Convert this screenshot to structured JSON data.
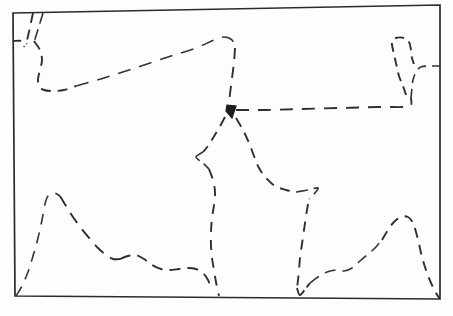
{
  "figure": {
    "kind": "hand-drawn-sketch-map",
    "title": "",
    "caption": "",
    "background_color": "#fdfdfc",
    "ink_color": "#2f2f33",
    "frame": {
      "name": "map-border",
      "style": "solid",
      "corners": [
        [
          13,
          13
        ],
        [
          440,
          5
        ],
        [
          440,
          299
        ],
        [
          15,
          296
        ]
      ]
    },
    "boundaries": [
      {
        "id": "northwest-inlet",
        "label": "",
        "style": "dashed",
        "dash_pattern": "10 7",
        "points": [
          [
            33,
            13
          ],
          [
            30,
            27
          ],
          [
            27,
            40
          ],
          [
            24,
            47
          ]
        ]
      },
      {
        "id": "northwest-inlet-second",
        "label": "",
        "style": "dashed",
        "dash_pattern": "11 6",
        "points": [
          [
            43,
            13
          ],
          [
            39,
            26
          ],
          [
            35,
            39
          ],
          [
            32,
            45
          ]
        ]
      },
      {
        "id": "west-edge-stub",
        "label": "",
        "style": "dashed",
        "dash_pattern": "8 6",
        "points": [
          [
            13,
            41
          ],
          [
            22,
            41
          ],
          [
            27,
            44
          ]
        ]
      },
      {
        "id": "northwest-lobe",
        "label": "",
        "style": "dashed",
        "dash_pattern": "10 7",
        "points": [
          [
            34,
            41
          ],
          [
            40,
            50
          ],
          [
            42,
            60
          ],
          [
            40,
            70
          ],
          [
            38,
            79
          ],
          [
            39,
            86
          ],
          [
            44,
            90
          ],
          [
            54,
            91
          ],
          [
            64,
            90
          ],
          [
            76,
            86
          ]
        ]
      },
      {
        "id": "north-long-ridge",
        "label": "",
        "style": "dashed",
        "dash_pattern": "13 9",
        "points": [
          [
            76,
            86
          ],
          [
            104,
            78
          ],
          [
            135,
            68
          ],
          [
            168,
            57
          ],
          [
            196,
            48
          ],
          [
            214,
            40
          ],
          [
            224,
            37
          ],
          [
            232,
            40
          ],
          [
            235,
            48
          ]
        ]
      },
      {
        "id": "central-descender",
        "label": "",
        "style": "dashed",
        "dash_pattern": "11 8",
        "points": [
          [
            235,
            48
          ],
          [
            234,
            62
          ],
          [
            232,
            78
          ],
          [
            230,
            94
          ],
          [
            229,
            104
          ]
        ]
      },
      {
        "id": "east-horizontal",
        "label": "",
        "style": "dashed",
        "dash_pattern": "13 9",
        "points": [
          [
            236,
            110
          ],
          [
            265,
            110
          ],
          [
            300,
            109
          ],
          [
            340,
            108
          ],
          [
            378,
            107
          ],
          [
            404,
            107
          ],
          [
            411,
            105
          ],
          [
            411,
            98
          ]
        ]
      },
      {
        "id": "northeast-peninsula-east-side",
        "label": "",
        "style": "dashed",
        "dash_pattern": "9 6",
        "points": [
          [
            411,
            98
          ],
          [
            412,
            88
          ],
          [
            413,
            80
          ],
          [
            416,
            72
          ],
          [
            421,
            67
          ],
          [
            430,
            66
          ],
          [
            440,
            66
          ]
        ]
      },
      {
        "id": "northeast-peninsula-west-side",
        "label": "",
        "style": "dashed",
        "dash_pattern": "9 6",
        "points": [
          [
            406,
            95
          ],
          [
            403,
            86
          ],
          [
            399,
            76
          ],
          [
            396,
            63
          ],
          [
            393,
            50
          ],
          [
            392,
            42
          ],
          [
            396,
            38
          ],
          [
            404,
            38
          ],
          [
            409,
            42
          ],
          [
            411,
            50
          ],
          [
            412,
            58
          ],
          [
            414,
            64
          ]
        ]
      },
      {
        "id": "central-peak-west-flank",
        "label": "",
        "style": "dashed",
        "dash_pattern": "10 7",
        "points": [
          [
            225,
            117
          ],
          [
            219,
            128
          ],
          [
            213,
            138
          ],
          [
            208,
            146
          ],
          [
            203,
            152
          ]
        ]
      },
      {
        "id": "central-notch",
        "label": "",
        "style": "dashed",
        "dash_pattern": "14 5",
        "points": [
          [
            203,
            152
          ],
          [
            196,
            157
          ],
          [
            203,
            163
          ],
          [
            209,
            169
          ]
        ]
      },
      {
        "id": "central-west-descender",
        "label": "",
        "style": "dashed",
        "dash_pattern": "10 8",
        "points": [
          [
            209,
            169
          ],
          [
            213,
            180
          ],
          [
            215,
            192
          ],
          [
            214,
            205
          ],
          [
            212,
            218
          ],
          [
            211,
            232
          ],
          [
            211,
            246
          ],
          [
            212,
            258
          ],
          [
            214,
            270
          ],
          [
            216,
            282
          ],
          [
            218,
            291
          ],
          [
            219,
            296
          ]
        ]
      },
      {
        "id": "central-peak-east-flank",
        "label": "",
        "style": "dashed",
        "dash_pattern": "10 7",
        "points": [
          [
            236,
            118
          ],
          [
            243,
            130
          ],
          [
            249,
            143
          ],
          [
            254,
            156
          ],
          [
            259,
            168
          ],
          [
            266,
            178
          ],
          [
            275,
            186
          ],
          [
            286,
            190
          ],
          [
            296,
            192
          ]
        ]
      },
      {
        "id": "central-east-hook",
        "label": "",
        "style": "dashed",
        "dash_pattern": "12 6",
        "points": [
          [
            296,
            192
          ],
          [
            308,
            190
          ],
          [
            318,
            188
          ],
          [
            314,
            194
          ],
          [
            309,
            199
          ]
        ]
      },
      {
        "id": "south-central-descender",
        "label": "",
        "style": "dashed",
        "dash_pattern": "10 8",
        "points": [
          [
            308,
            204
          ],
          [
            306,
            216
          ],
          [
            304,
            230
          ],
          [
            302,
            244
          ],
          [
            300,
            258
          ],
          [
            299,
            270
          ],
          [
            298,
            280
          ],
          [
            297,
            288
          ]
        ]
      },
      {
        "id": "south-central-vee",
        "label": "",
        "style": "dashed",
        "dash_pattern": "14 4",
        "points": [
          [
            297,
            288
          ],
          [
            300,
            295
          ],
          [
            306,
            288
          ],
          [
            310,
            283
          ]
        ]
      },
      {
        "id": "southwest-rise",
        "label": "",
        "style": "dashed",
        "dash_pattern": "11 8",
        "points": [
          [
            16,
            296
          ],
          [
            22,
            286
          ],
          [
            28,
            272
          ],
          [
            33,
            256
          ],
          [
            38,
            238
          ],
          [
            42,
            220
          ],
          [
            45,
            204
          ],
          [
            48,
            196
          ],
          [
            54,
            193
          ],
          [
            60,
            196
          ]
        ]
      },
      {
        "id": "southwest-descent",
        "label": "",
        "style": "dashed",
        "dash_pattern": "12 8",
        "points": [
          [
            60,
            196
          ],
          [
            66,
            206
          ],
          [
            73,
            217
          ],
          [
            81,
            228
          ],
          [
            90,
            239
          ],
          [
            98,
            248
          ],
          [
            106,
            255
          ],
          [
            113,
            259
          ],
          [
            120,
            259
          ]
        ]
      },
      {
        "id": "south-wavy-belt",
        "label": "",
        "style": "dashed",
        "dash_pattern": "11 7",
        "points": [
          [
            120,
            259
          ],
          [
            128,
            256
          ],
          [
            136,
            255
          ],
          [
            144,
            259
          ],
          [
            152,
            265
          ],
          [
            161,
            269
          ],
          [
            170,
            270
          ],
          [
            179,
            269
          ],
          [
            188,
            268
          ],
          [
            196,
            269
          ],
          [
            203,
            273
          ],
          [
            208,
            280
          ],
          [
            211,
            288
          ]
        ]
      },
      {
        "id": "southeast-wavy-belt",
        "label": "",
        "style": "dashed",
        "dash_pattern": "11 7",
        "points": [
          [
            310,
            283
          ],
          [
            318,
            277
          ],
          [
            327,
            272
          ],
          [
            336,
            270
          ],
          [
            344,
            271
          ],
          [
            352,
            268
          ],
          [
            360,
            261
          ],
          [
            368,
            254
          ],
          [
            375,
            248
          ],
          [
            382,
            240
          ]
        ]
      },
      {
        "id": "southeast-peak",
        "label": "",
        "style": "dashed",
        "dash_pattern": "10 7",
        "points": [
          [
            382,
            240
          ],
          [
            388,
            230
          ],
          [
            394,
            222
          ],
          [
            401,
            217
          ],
          [
            408,
            217
          ],
          [
            413,
            223
          ],
          [
            416,
            232
          ],
          [
            419,
            244
          ],
          [
            422,
            257
          ],
          [
            426,
            270
          ],
          [
            431,
            283
          ],
          [
            436,
            293
          ],
          [
            440,
            299
          ]
        ]
      }
    ],
    "junction": {
      "id": "triple-junction-mark",
      "x": 231,
      "y": 110,
      "shape": "solid-arrow-wedge"
    }
  }
}
